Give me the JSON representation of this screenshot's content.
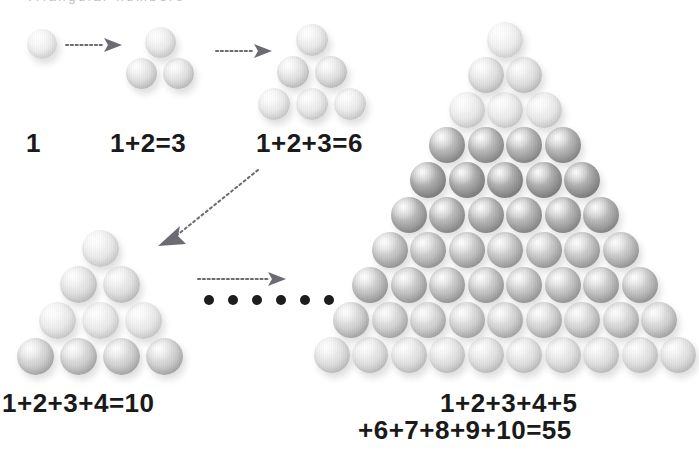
{
  "page": {
    "title": "Triangular Numbers",
    "width": 699,
    "height": 452,
    "background": "#ffffff",
    "header_text_faint": "Triangular numbers"
  },
  "colors": {
    "text": "#1a1a1a",
    "arrow": "#6b6b72",
    "dot": "#1d1d1d",
    "faint_header": "#b9bcc4",
    "ball_light": "#ededed",
    "ball_medium": "#c8c8c8",
    "ball_dark": "#9a9a9a"
  },
  "captions": [
    {
      "id": "cap-1",
      "text": "1",
      "x": 26,
      "y": 128,
      "size": 26
    },
    {
      "id": "cap-3",
      "text": "1+2=3",
      "x": 110,
      "y": 128,
      "size": 26
    },
    {
      "id": "cap-6",
      "text": "1+2+3=6",
      "x": 256,
      "y": 128,
      "size": 26
    },
    {
      "id": "cap-10",
      "text": "1+2+3+4=10",
      "x": 2,
      "y": 388,
      "size": 26
    },
    {
      "id": "cap-55a",
      "text": "1+2+3+4+5",
      "x": 440,
      "y": 388,
      "size": 26
    },
    {
      "id": "cap-55b",
      "text": "+6+7+8+9+10=55",
      "x": 358,
      "y": 415,
      "size": 26
    }
  ],
  "groups": [
    {
      "id": "group-1",
      "label": "single-ball",
      "rows": 1,
      "caption": "1",
      "value": 1,
      "origin": {
        "x": 42,
        "y": 44
      },
      "ball_diameter": 30,
      "spacing": {
        "x": 34,
        "y": 30
      },
      "tones": [
        "tone-xlight"
      ]
    },
    {
      "id": "group-3",
      "label": "triangle-3",
      "rows": 2,
      "caption": "1+2=3",
      "value": 3,
      "origin": {
        "x": 160,
        "y": 42
      },
      "ball_diameter": 31,
      "spacing": {
        "x": 37,
        "y": 31
      },
      "tones": [
        "tone-light",
        "tone-mlight"
      ]
    },
    {
      "id": "group-6",
      "label": "triangle-6",
      "rows": 3,
      "caption": "1+2+3=6",
      "value": 6,
      "origin": {
        "x": 312,
        "y": 40
      },
      "ball_diameter": 32,
      "spacing": {
        "x": 38,
        "y": 32
      },
      "tones": [
        "tone-light",
        "tone-mlight",
        "tone-light"
      ]
    },
    {
      "id": "group-10",
      "label": "triangle-10",
      "rows": 4,
      "caption": "1+2+3+4=10",
      "value": 10,
      "origin": {
        "x": 100,
        "y": 248
      },
      "ball_diameter": 37,
      "spacing": {
        "x": 43,
        "y": 36
      },
      "tones": [
        "tone-light",
        "tone-mlight",
        "tone-light",
        "tone-med"
      ]
    },
    {
      "id": "group-55",
      "label": "triangle-55",
      "rows": 10,
      "caption": "1+2+3+4+5+6+7+8+9+10=55",
      "value": 55,
      "origin": {
        "x": 505,
        "y": 40
      },
      "ball_diameter": 36,
      "spacing": {
        "x": 38.5,
        "y": 35
      },
      "tones": [
        "tone-xlight",
        "tone-mlight",
        "tone-light",
        "tone-dark",
        "tone-xdark",
        "tone-dark",
        "tone-mdark",
        "tone-mdark",
        "tone-med",
        "tone-mlight"
      ]
    }
  ],
  "arrows": [
    {
      "id": "arrow-1-to-3",
      "label": "dotted-arrow-right",
      "direction": "right",
      "x": 68,
      "y": 44,
      "length": 52,
      "style": "dotted"
    },
    {
      "id": "arrow-3-to-6",
      "label": "dotted-arrow-right",
      "direction": "right",
      "x": 218,
      "y": 50,
      "length": 52,
      "style": "dotted"
    },
    {
      "id": "arrow-6-to-10",
      "label": "dotted-arrow-diagonal",
      "direction": "down-left",
      "x1": 254,
      "y1": 172,
      "x2": 160,
      "y2": 243,
      "style": "dotted"
    },
    {
      "id": "arrow-10-to-55",
      "label": "dotted-arrow-right",
      "direction": "right",
      "x": 198,
      "y": 278,
      "length": 82,
      "style": "dotted"
    }
  ],
  "ellipsis": {
    "id": "ellipsis-dots",
    "count": 6,
    "x": 204,
    "y": 295
  },
  "chart_data": {
    "type": "diagram",
    "title": "Triangular numbers",
    "sequence": [
      1,
      3,
      6,
      10,
      55
    ],
    "expressions": [
      "1",
      "1+2=3",
      "1+2+3=6",
      "1+2+3+4=10",
      "1+2+3+4+5+6+7+8+9+10=55"
    ],
    "row_counts": {
      "group-1": [
        1
      ],
      "group-3": [
        1,
        2
      ],
      "group-6": [
        1,
        2,
        3
      ],
      "group-10": [
        1,
        2,
        3,
        4
      ],
      "group-55": [
        1,
        2,
        3,
        4,
        5,
        6,
        7,
        8,
        9,
        10
      ]
    }
  }
}
